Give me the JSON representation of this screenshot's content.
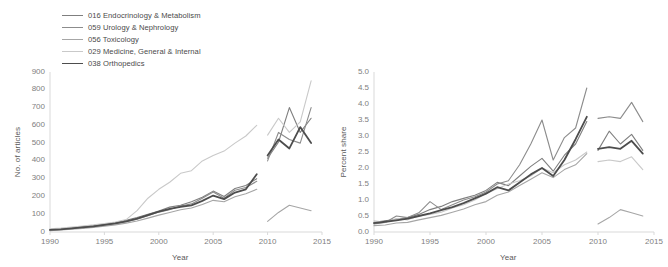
{
  "legend": {
    "position": "top-left",
    "entries": [
      {
        "label": "016 Endocrinology & Metabolism",
        "color": "#7f7f7f",
        "width": 1.1
      },
      {
        "label": "059 Urology & Nephrology",
        "color": "#8c8c8c",
        "width": 1.1
      },
      {
        "label": "056 Toxicology",
        "color": "#a6a6a6",
        "width": 1.1
      },
      {
        "label": "029 Medicine, General & Internal",
        "color": "#c9c9c9",
        "width": 1.1
      },
      {
        "label": "038 Orthopedics",
        "color": "#4d4d4d",
        "width": 1.8
      }
    ]
  },
  "chart_data": [
    {
      "id": "articles",
      "type": "line",
      "title": "",
      "xlabel": "Year",
      "ylabel": "No. of articles",
      "xlim": [
        1990,
        2015
      ],
      "ylim": [
        0,
        900
      ],
      "xticks": [
        1990,
        1995,
        2000,
        2005,
        2010,
        2015
      ],
      "xtick_labels": [
        "1990",
        "1995",
        "2000",
        "2005",
        "2010",
        "2015"
      ],
      "yticks": [
        0,
        100,
        200,
        300,
        400,
        500,
        600,
        700,
        800,
        900
      ],
      "ytick_labels": [
        "0",
        "100",
        "200",
        "300",
        "400",
        "500",
        "600",
        "700",
        "800",
        "900"
      ],
      "grid": false,
      "legend": "shared",
      "series": [
        {
          "name": "016 Endocrinology & Metabolism",
          "color": "#7f7f7f",
          "width": 1.1,
          "segments": [
            {
              "x": [
                1990,
                1991,
                1992,
                1993,
                1994,
                1995,
                1996,
                1997,
                1998,
                1999,
                2000,
                2001,
                2002,
                2003,
                2004,
                2005,
                2006,
                2007,
                2008,
                2009
              ],
              "y": [
                14,
                18,
                22,
                30,
                36,
                44,
                52,
                66,
                82,
                100,
                118,
                140,
                150,
                170,
                196,
                230,
                200,
                245,
                262,
                300
              ]
            },
            {
              "x": [
                2010,
                2011,
                2012,
                2013,
                2014
              ],
              "y": [
                415,
                505,
                700,
                560,
                640
              ]
            }
          ]
        },
        {
          "name": "059 Urology & Nephrology",
          "color": "#8c8c8c",
          "width": 1.1,
          "segments": [
            {
              "x": [
                1990,
                1991,
                1992,
                1993,
                1994,
                1995,
                1996,
                1997,
                1998,
                1999,
                2000,
                2001,
                2002,
                2003,
                2004,
                2005,
                2006,
                2007,
                2008,
                2009
              ],
              "y": [
                10,
                14,
                18,
                24,
                30,
                38,
                46,
                58,
                72,
                92,
                112,
                126,
                146,
                158,
                190,
                225,
                190,
                235,
                250,
                285
              ]
            },
            {
              "x": [
                2010,
                2011,
                2012,
                2013,
                2014
              ],
              "y": [
                400,
                560,
                520,
                500,
                700
              ]
            }
          ]
        },
        {
          "name": "056 Toxicology",
          "color": "#a6a6a6",
          "width": 1.1,
          "segments": [
            {
              "x": [
                1990,
                1991,
                1992,
                1993,
                1994,
                1995,
                1996,
                1997,
                1998,
                1999,
                2000,
                2001,
                2002,
                2003,
                2004,
                2005,
                2006,
                2007,
                2008,
                2009
              ],
              "y": [
                8,
                12,
                16,
                20,
                26,
                32,
                40,
                50,
                62,
                78,
                95,
                110,
                125,
                135,
                155,
                178,
                170,
                198,
                215,
                240
              ]
            },
            {
              "x": [
                2010,
                2011,
                2012,
                2013,
                2014
              ],
              "y": [
                60,
                110,
                150,
                135,
                120
              ]
            }
          ]
        },
        {
          "name": "029 Medicine, General & Internal",
          "color": "#c9c9c9",
          "width": 1.1,
          "segments": [
            {
              "x": [
                1990,
                1991,
                1992,
                1993,
                1994,
                1995,
                1996,
                1997,
                1998,
                1999,
                2000,
                2001,
                2002,
                2003,
                2004,
                2005,
                2006,
                2007,
                2008,
                2009
              ],
              "y": [
                18,
                22,
                28,
                34,
                40,
                48,
                56,
                70,
                120,
                190,
                240,
                280,
                330,
                345,
                400,
                430,
                455,
                500,
                540,
                600
              ]
            },
            {
              "x": [
                2010,
                2011,
                2012,
                2013,
                2014
              ],
              "y": [
                545,
                640,
                560,
                620,
                850
              ]
            }
          ]
        },
        {
          "name": "038 Orthopedics",
          "color": "#4d4d4d",
          "width": 1.8,
          "segments": [
            {
              "x": [
                1990,
                1991,
                1992,
                1993,
                1994,
                1995,
                1996,
                1997,
                1998,
                1999,
                2000,
                2001,
                2002,
                2003,
                2004,
                2005,
                2006,
                2007,
                2008,
                2009
              ],
              "y": [
                12,
                15,
                20,
                26,
                32,
                40,
                48,
                60,
                75,
                95,
                115,
                130,
                142,
                150,
                175,
                205,
                185,
                222,
                240,
                325
              ]
            },
            {
              "x": [
                2010,
                2011,
                2012,
                2013,
                2014
              ],
              "y": [
                430,
                520,
                470,
                590,
                500
              ]
            }
          ]
        }
      ]
    },
    {
      "id": "share",
      "type": "line",
      "title": "",
      "xlabel": "Year",
      "ylabel": "Percent share",
      "xlim": [
        1990,
        2015
      ],
      "ylim": [
        0,
        5
      ],
      "xticks": [
        1990,
        1995,
        2000,
        2005,
        2010,
        2015
      ],
      "xtick_labels": [
        "1990",
        "1995",
        "2000",
        "2005",
        "2010",
        "2015"
      ],
      "yticks": [
        0,
        0.5,
        1,
        1.5,
        2,
        2.5,
        3,
        3.5,
        4,
        4.5,
        5
      ],
      "ytick_labels": [
        "0.0",
        "0.5",
        "1.0",
        "1.5",
        "2.0",
        "2.5",
        "3.0",
        "3.5",
        "4.0",
        "4.5",
        "5.0"
      ],
      "grid": false,
      "legend": "shared",
      "series": [
        {
          "name": "016 Endocrinology & Metabolism",
          "color": "#7f7f7f",
          "width": 1.1,
          "segments": [
            {
              "x": [
                1990,
                1991,
                1992,
                1993,
                1994,
                1995,
                1996,
                1997,
                1998,
                1999,
                2000,
                2001,
                2002,
                2003,
                2004,
                2005,
                2006,
                2007,
                2008,
                2009
              ],
              "y": [
                0.3,
                0.35,
                0.4,
                0.45,
                0.55,
                0.7,
                0.8,
                0.95,
                1.05,
                1.15,
                1.3,
                1.55,
                1.45,
                1.75,
                2.05,
                2.3,
                1.9,
                2.4,
                2.75,
                3.45
              ]
            },
            {
              "x": [
                2010,
                2011,
                2012,
                2013,
                2014
              ],
              "y": [
                2.55,
                3.15,
                2.75,
                3.05,
                2.55
              ]
            }
          ]
        },
        {
          "name": "059 Urology & Nephrology",
          "color": "#8c8c8c",
          "width": 1.1,
          "segments": [
            {
              "x": [
                1990,
                1991,
                1992,
                1993,
                1994,
                1995,
                1996,
                1997,
                1998,
                1999,
                2000,
                2001,
                2002,
                2003,
                2004,
                2005,
                2006,
                2007,
                2008,
                2009
              ],
              "y": [
                0.25,
                0.3,
                0.5,
                0.45,
                0.6,
                0.95,
                0.7,
                0.85,
                1.0,
                1.1,
                1.25,
                1.5,
                1.6,
                2.1,
                2.75,
                3.5,
                2.25,
                2.95,
                3.25,
                4.5
              ]
            },
            {
              "x": [
                2010,
                2011,
                2012,
                2013,
                2014
              ],
              "y": [
                3.55,
                3.6,
                3.55,
                4.05,
                3.45
              ]
            }
          ]
        },
        {
          "name": "056 Toxicology",
          "color": "#a6a6a6",
          "width": 1.1,
          "segments": [
            {
              "x": [
                1990,
                1991,
                1992,
                1993,
                1994,
                1995,
                1996,
                1997,
                1998,
                1999,
                2000,
                2001,
                2002,
                2003,
                2004,
                2005,
                2006,
                2007,
                2008,
                2009
              ],
              "y": [
                0.2,
                0.22,
                0.28,
                0.3,
                0.38,
                0.45,
                0.52,
                0.62,
                0.72,
                0.85,
                0.95,
                1.15,
                1.25,
                1.45,
                1.65,
                1.85,
                1.7,
                1.95,
                2.1,
                2.45
              ]
            },
            {
              "x": [
                2010,
                2011,
                2012,
                2013,
                2014
              ],
              "y": [
                0.25,
                0.45,
                0.7,
                0.6,
                0.5
              ]
            }
          ]
        },
        {
          "name": "029 Medicine, General & Internal",
          "color": "#c9c9c9",
          "width": 1.1,
          "segments": [
            {
              "x": [
                1990,
                1991,
                1992,
                1993,
                1994,
                1995,
                1996,
                1997,
                1998,
                1999,
                2000,
                2001,
                2002,
                2003,
                2004,
                2005,
                2006,
                2007,
                2008,
                2009
              ],
              "y": [
                0.35,
                0.3,
                0.42,
                0.38,
                0.5,
                0.55,
                0.62,
                0.75,
                0.85,
                1.0,
                1.2,
                1.35,
                1.5,
                1.6,
                1.75,
                2.0,
                1.85,
                2.1,
                2.25,
                2.5
              ]
            },
            {
              "x": [
                2010,
                2011,
                2012,
                2013,
                2014
              ],
              "y": [
                2.2,
                2.25,
                2.2,
                2.35,
                1.95
              ]
            }
          ]
        },
        {
          "name": "038 Orthopedics",
          "color": "#4d4d4d",
          "width": 1.8,
          "segments": [
            {
              "x": [
                1990,
                1991,
                1992,
                1993,
                1994,
                1995,
                1996,
                1997,
                1998,
                1999,
                2000,
                2001,
                2002,
                2003,
                2004,
                2005,
                2006,
                2007,
                2008,
                2009
              ],
              "y": [
                0.28,
                0.32,
                0.36,
                0.42,
                0.5,
                0.58,
                0.68,
                0.78,
                0.9,
                1.05,
                1.2,
                1.4,
                1.3,
                1.55,
                1.8,
                2.0,
                1.75,
                2.25,
                2.9,
                3.6
              ]
            },
            {
              "x": [
                2010,
                2011,
                2012,
                2013,
                2014
              ],
              "y": [
                2.6,
                2.65,
                2.6,
                2.85,
                2.45
              ]
            }
          ]
        }
      ]
    }
  ]
}
